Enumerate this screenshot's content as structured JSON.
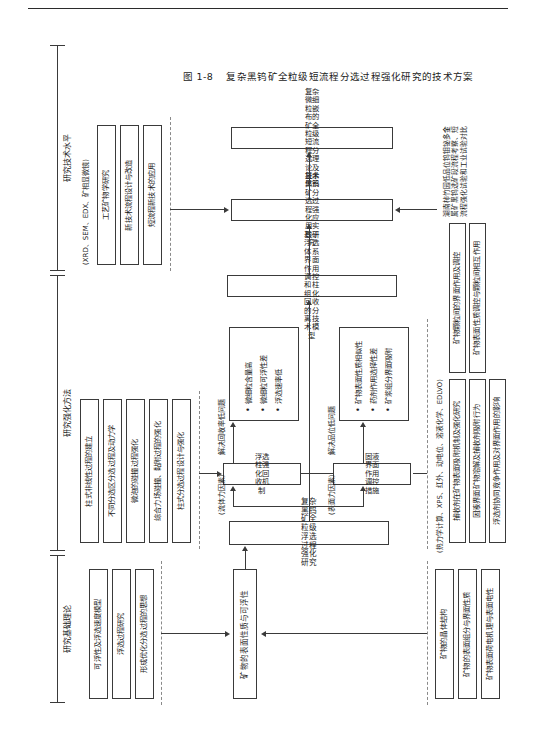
{
  "figure": {
    "caption_number": "图 1-8",
    "caption_text": "复杂黑钨矿全粒级短流程分选过程强化研究的技术方案"
  },
  "sections": [
    {
      "id": "basic-theory",
      "title": "研究基础理论"
    },
    {
      "id": "intensify",
      "title": "研究强化方法"
    },
    {
      "id": "tech-level",
      "title": "研究技术水平"
    }
  ],
  "outcomes_top": {
    "group_label": "研究基础理论",
    "items": [
      "可浮性及浮选速度模型",
      "浮选过程研究",
      "形成优化分选过程的思想"
    ]
  },
  "methods_top": {
    "group_label": "研究强化方法",
    "items": [
      "柱式非线性过程的建立",
      "不同分选区分选过程及动力学",
      "微泡的碰撞过程强化",
      "综合力场碰撞、黏附过程的强化",
      "柱式分选过程设计与强化"
    ]
  },
  "tech_top": {
    "group_label": "研究技术水平",
    "note": "(XRD、SEM、EDX、矿相显微镜)",
    "items": [
      "工艺矿物学研究",
      "新技术流程设计与改造",
      "短流程新技术的应用"
    ]
  },
  "foundation_bottom": {
    "note": "(热力学计算、XPS、红外、动电位、溶液化学、EDLVO)",
    "items": [
      "矿物的晶体结构",
      "矿物的表面组分与界面性质",
      "矿物表面荷电机理与表面电性"
    ]
  },
  "interface_bottom": {
    "items": [
      "捕收剂在矿物表面吸附机制及强化研究",
      "固液界面矿物溶解及捕收剂吸附行为",
      "浮选剂协同竞争作用及对界面作用的影响",
      "矿物颗粒间的界面作用及调控",
      "矿物表面性质调控与颗粒间相互作用"
    ]
  },
  "spine": {
    "node_surface": "矿物的表面性质与可浮性",
    "node_core": "复杂黑钨矿全粒级浮选过程强化研究",
    "node_model": "基于浮选体系界面作用调控和柱组化回收的分离技术模型",
    "node_apply": "复杂黑钨矿分选过程强化应用实践研究",
    "node_result": "复杂微细粒嵌布的矿全粒级短流程分选理论及技术体系"
  },
  "branches": {
    "fluid_factor_label": "(流体力因素)",
    "surface_factor_label": "(表面力因素)",
    "node_column": "浮选柱强化回收机制",
    "node_interface": "固液界面作用调控措施",
    "problem_recovery": "解决回收率低问题",
    "problem_grade": "解决品位低问题",
    "recovery_points": [
      "微细粒含量高",
      "微细粒可浮性差",
      "浮选速率低"
    ],
    "grade_points": [
      "矿物表面性质相似性",
      "药剂作用选择性差",
      "矿浆组分界面吸附"
    ]
  },
  "apply_note": {
    "text": "湖南柿竹园低品位钨钼铋多金属矿黑钨选矿段流程考察、短流程强化试验和工业试验对比"
  }
}
